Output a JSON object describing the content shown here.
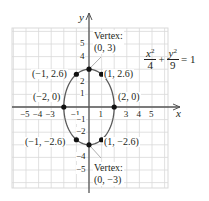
{
  "chart_data": {
    "type": "line",
    "title": "",
    "equation": {
      "x_num": "x",
      "x_den": "4",
      "y_num": "y",
      "y_den": "9",
      "plus": "+",
      "equals": "= 1",
      "exp": "2"
    },
    "xlabel": "x",
    "ylabel": "y",
    "xlim": [
      -6,
      6
    ],
    "ylim": [
      -6,
      6
    ],
    "grid": true,
    "x_ticks": [
      "-5",
      "-4",
      "-3",
      "-1",
      "1",
      "3",
      "4",
      "5"
    ],
    "x_tick_values": [
      -5,
      -4,
      -3,
      -1,
      1,
      3,
      4,
      5
    ],
    "y_ticks": [
      "5",
      "4",
      "2",
      "1",
      "-1",
      "-2",
      "-4",
      "-5"
    ],
    "y_tick_values": [
      5,
      4,
      2,
      1,
      -1,
      -2,
      -4,
      -5
    ],
    "ellipse": {
      "a": 2,
      "b": 3,
      "center": [
        0,
        0
      ]
    },
    "points": [
      {
        "x": 0,
        "y": 3,
        "label": ""
      },
      {
        "x": -1,
        "y": 2.6,
        "label": "(−1, 2.6)"
      },
      {
        "x": 1,
        "y": 2.6,
        "label": "(1, 2.6)"
      },
      {
        "x": -2,
        "y": 0,
        "label": "(−2, 0)"
      },
      {
        "x": 2,
        "y": 0,
        "label": "(2, 0)"
      },
      {
        "x": -1,
        "y": -2.6,
        "label": "(−1, −2.6)"
      },
      {
        "x": 1,
        "y": -2.6,
        "label": "(1, −2.6)"
      },
      {
        "x": 0,
        "y": -3,
        "label": ""
      }
    ],
    "annotations": [
      {
        "title": "Vertex:",
        "coords": "(0, 3)",
        "x": 0,
        "y": 3
      },
      {
        "title": "Vertex:",
        "coords": "(0, −3)",
        "x": 0,
        "y": -3
      }
    ],
    "colors": {
      "curve": "#5a5a5a",
      "axis": "#555555",
      "grid": "#d9d9d9",
      "point": "#111111",
      "text": "#231f20"
    }
  }
}
